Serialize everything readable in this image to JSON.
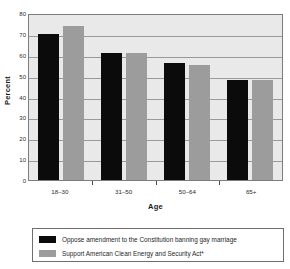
{
  "chart_data": {
    "type": "bar",
    "title": "",
    "xlabel": "Age",
    "ylabel": "Percent",
    "categories": [
      "18–30",
      "31–50",
      "50–64",
      "65+"
    ],
    "series": [
      {
        "name": "Oppose amendment to the Constitution banning gay marriage",
        "color": "#0b0b0b",
        "values": [
          70,
          61,
          56,
          48
        ]
      },
      {
        "name": "Support American Clean Energy and Security Act*",
        "color": "#9c9c9c",
        "values": [
          74,
          61,
          55,
          48
        ]
      }
    ],
    "ylim": [
      0,
      80
    ],
    "yticks": [
      0,
      10,
      20,
      30,
      40,
      50,
      60,
      70,
      80
    ],
    "ytick_labels": [
      "0",
      "10",
      "20",
      "30",
      "40",
      "50",
      "60",
      "70",
      "80"
    ],
    "grid": "horizontal",
    "legend_position": "bottom",
    "plot_background": "#e9e9e9",
    "grid_color": "#9a9a9a",
    "axis_color": "#7d7d7d"
  },
  "legend": {
    "entries": [
      {
        "label": "Oppose amendment to the Constitution banning gay marriage"
      },
      {
        "label": "Support American Clean Energy and Security Act*"
      }
    ]
  }
}
